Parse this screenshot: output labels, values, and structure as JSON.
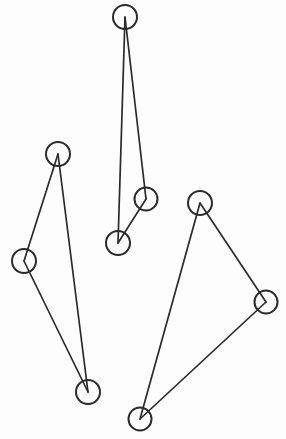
{
  "figure": {
    "kind": "node-link-graph-drawing",
    "width": 286,
    "height": 439,
    "background_color": "#fdfdfd",
    "stroke_color": "#2b2b2b",
    "node_fill": "none",
    "node_radius": 12,
    "edge_width": 1.7,
    "node_stroke_width": 2.0,
    "component_count": 3,
    "node_count": 9,
    "edge_count": 9
  },
  "nodes": [
    {
      "id": "n1",
      "name": "node-left-top",
      "cx": 58,
      "cy": 154,
      "r": 12,
      "component": 1
    },
    {
      "id": "n2",
      "name": "node-left-middle",
      "cx": 24,
      "cy": 261,
      "r": 12,
      "component": 1
    },
    {
      "id": "n3",
      "name": "node-left-bottom",
      "cx": 88,
      "cy": 392,
      "r": 12,
      "component": 1
    },
    {
      "id": "n4",
      "name": "node-middle-top",
      "cx": 125,
      "cy": 17,
      "r": 12,
      "component": 2
    },
    {
      "id": "n5",
      "name": "node-middle-right",
      "cx": 146,
      "cy": 199,
      "r": 11.5,
      "component": 2
    },
    {
      "id": "n6",
      "name": "node-middle-bottom",
      "cx": 118,
      "cy": 243,
      "r": 12,
      "component": 2
    },
    {
      "id": "n7",
      "name": "node-right-top",
      "cx": 200,
      "cy": 203,
      "r": 12,
      "component": 3
    },
    {
      "id": "n8",
      "name": "node-right-middle",
      "cx": 266,
      "cy": 302,
      "r": 11.5,
      "component": 3
    },
    {
      "id": "n9",
      "name": "node-right-bottom",
      "cx": 140,
      "cy": 419,
      "r": 11.5,
      "component": 3
    }
  ],
  "edges": [
    {
      "id": "e1",
      "name": "edge-left-top-to-left-middle",
      "from": "n1",
      "to": "n2",
      "component": 1
    },
    {
      "id": "e2",
      "name": "edge-left-top-to-left-bottom",
      "from": "n1",
      "to": "n3",
      "component": 1
    },
    {
      "id": "e3",
      "name": "edge-left-middle-to-left-bottom",
      "from": "n2",
      "to": "n3",
      "component": 1
    },
    {
      "id": "e4",
      "name": "edge-middle-top-to-middle-right",
      "from": "n4",
      "to": "n5",
      "component": 2
    },
    {
      "id": "e5",
      "name": "edge-middle-top-to-middle-bottom",
      "from": "n4",
      "to": "n6",
      "component": 2
    },
    {
      "id": "e6",
      "name": "edge-middle-right-to-middle-bottom",
      "from": "n5",
      "to": "n6",
      "component": 2
    },
    {
      "id": "e7",
      "name": "edge-right-top-to-right-middle",
      "from": "n7",
      "to": "n8",
      "component": 3
    },
    {
      "id": "e8",
      "name": "edge-right-top-to-right-bottom",
      "from": "n7",
      "to": "n9",
      "component": 3
    },
    {
      "id": "e9",
      "name": "edge-right-middle-to-right-bottom",
      "from": "n8",
      "to": "n9",
      "component": 3
    }
  ]
}
